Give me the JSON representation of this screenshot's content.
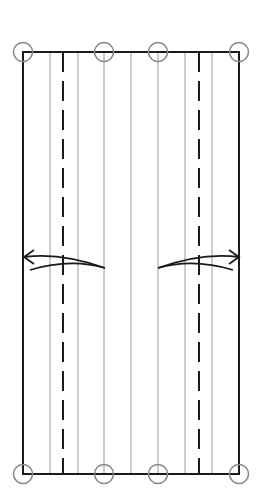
{
  "diagram": {
    "type": "origami-fold-diagram",
    "colors": {
      "border": "#1a1a1a",
      "crease": "#9a9a9a",
      "valley": "#1a1a1a",
      "marker": "#8a8a8a",
      "arrow": "#1a1a1a"
    },
    "sheet": {
      "x1": 23,
      "y1": 52,
      "x2": 239,
      "y2": 474
    },
    "creases": [
      50,
      78,
      104,
      131,
      158,
      185,
      212
    ],
    "valley_folds": [
      63,
      199
    ],
    "markers": [
      {
        "x": 23,
        "y": 52
      },
      {
        "x": 104,
        "y": 52
      },
      {
        "x": 158,
        "y": 52
      },
      {
        "x": 239,
        "y": 52
      },
      {
        "x": 23,
        "y": 474
      },
      {
        "x": 104,
        "y": 474
      },
      {
        "x": 158,
        "y": 474
      },
      {
        "x": 239,
        "y": 474
      }
    ],
    "arrows": [
      {
        "name": "fold-left-arrow",
        "direction": "left"
      },
      {
        "name": "fold-right-arrow",
        "direction": "right"
      }
    ]
  }
}
